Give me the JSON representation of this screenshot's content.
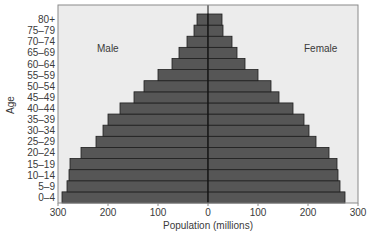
{
  "chart_data": {
    "type": "bar",
    "subtype": "population-pyramid",
    "title": "",
    "xlabel": "Population (millions)",
    "ylabel": "Age",
    "xlim": [
      -300,
      300
    ],
    "x_ticks": [
      300,
      200,
      100,
      0,
      100,
      200,
      300
    ],
    "grid": false,
    "legend": "inline labels",
    "categories": [
      "0–4",
      "5–9",
      "10–14",
      "15–19",
      "20–24",
      "25–29",
      "30–34",
      "35–39",
      "40–44",
      "45–49",
      "50–54",
      "55–59",
      "60–64",
      "65–69",
      "70–74",
      "75–79",
      "80+"
    ],
    "series": [
      {
        "name": "Male",
        "values": [
          292,
          282,
          278,
          276,
          254,
          224,
          210,
          200,
          176,
          148,
          128,
          100,
          72,
          58,
          42,
          28,
          22
        ]
      },
      {
        "name": "Female",
        "values": [
          274,
          264,
          260,
          258,
          242,
          216,
          202,
          192,
          170,
          142,
          126,
          100,
          74,
          58,
          48,
          30,
          28
        ]
      }
    ],
    "annotations": [
      "Male",
      "Female"
    ]
  },
  "colors": {
    "background": "#ffffff",
    "plot_background": "#ececec",
    "bar_fill": "#565656",
    "bar_edge": "#1e1e1e",
    "frame": "#8a8a8a",
    "center_line": "#111111",
    "text": "#3a3a3a"
  },
  "labels": {
    "male": "Male",
    "female": "Female",
    "xlabel": "Population (millions)",
    "ylabel": "Age"
  }
}
